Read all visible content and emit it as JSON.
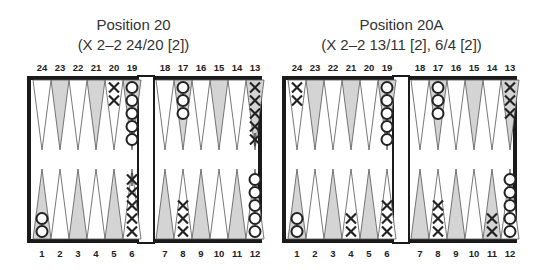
{
  "diagrams": [
    {
      "title": "Position 20",
      "subtitle": "(X 2–2 24/20 [2])",
      "board_origin_x": 27,
      "checkers": {
        "13": {
          "player": "X",
          "count": 5,
          "moved_marks": [
            4
          ]
        },
        "17": {
          "player": "O",
          "count": 3
        },
        "19": {
          "player": "O",
          "count": 5
        },
        "20": {
          "player": "X",
          "count": 2
        },
        "1": {
          "player": "O",
          "count": 2
        },
        "6": {
          "player": "X",
          "count": 5,
          "moved_marks": [
            4
          ]
        },
        "8": {
          "player": "X",
          "count": 3
        },
        "12": {
          "player": "O",
          "count": 5
        }
      }
    },
    {
      "title": "Position 20A",
      "subtitle": "(X 2–2 13/11 [2], 6/4 [2])",
      "board_origin_x": 282,
      "checkers": {
        "24": {
          "player": "X",
          "count": 2
        },
        "19": {
          "player": "O",
          "count": 5
        },
        "17": {
          "player": "O",
          "count": 3
        },
        "13": {
          "player": "X",
          "count": 3
        },
        "1": {
          "player": "O",
          "count": 2
        },
        "4": {
          "player": "X",
          "count": 2
        },
        "6": {
          "player": "X",
          "count": 3
        },
        "8": {
          "player": "X",
          "count": 3
        },
        "11": {
          "player": "X",
          "count": 2
        },
        "12": {
          "player": "O",
          "count": 5
        }
      }
    }
  ],
  "top_point_labels_left": [
    "24",
    "23",
    "22",
    "21",
    "20",
    "19"
  ],
  "top_point_labels_right": [
    "18",
    "17",
    "16",
    "15",
    "14",
    "13"
  ],
  "bottom_point_labels_left": [
    "1",
    "2",
    "3",
    "4",
    "5",
    "6"
  ],
  "bottom_point_labels_right": [
    "7",
    "8",
    "9",
    "10",
    "11",
    "12"
  ],
  "colors": {
    "frame": "#1a1a1a",
    "shaded_point": "#d4d4d4",
    "white_point": "#ffffff",
    "ink": "#222222"
  }
}
